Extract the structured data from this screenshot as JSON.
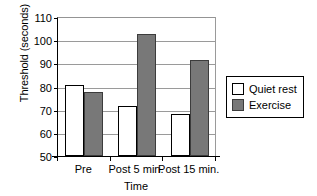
{
  "chart_data": {
    "type": "bar",
    "title": "",
    "xlabel": "Time",
    "ylabel": "Threshold (seconds)",
    "categories": [
      "Pre",
      "Post 5 min.",
      "Post 15 min."
    ],
    "series": [
      {
        "name": "Quiet rest",
        "values": [
          80.5,
          71.5,
          68.0
        ],
        "color": "#ffffff"
      },
      {
        "name": "Exercise",
        "values": [
          77.5,
          102.5,
          91.5
        ],
        "color": "#787878"
      }
    ],
    "ylim": [
      50,
      110
    ],
    "yticks": [
      110,
      100,
      90,
      80,
      70,
      60,
      50
    ],
    "ytick_labels": [
      "110",
      "100",
      "90",
      "80",
      "70",
      "60",
      "50"
    ],
    "grid": true,
    "legend_position": "right"
  }
}
